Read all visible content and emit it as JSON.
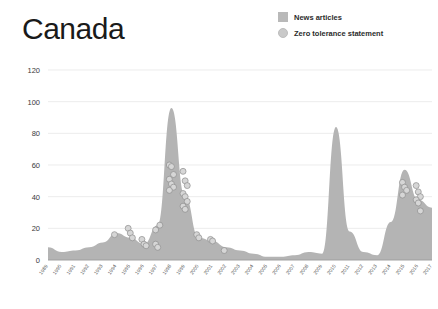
{
  "title": "Canada",
  "legend": {
    "items": [
      {
        "label": "News articles",
        "marker": "square",
        "color": "#b9b9b9"
      },
      {
        "label": "Zero tolerance statement",
        "marker": "circle",
        "color": "#c9c9c9"
      }
    ]
  },
  "chart_data": {
    "type": "area",
    "title": "Canada",
    "xlabel": "",
    "ylabel": "",
    "ylim": [
      0,
      120
    ],
    "yticks": [
      0,
      20,
      40,
      60,
      80,
      100,
      120
    ],
    "grid": true,
    "legend_position": "top-right",
    "categories": [
      "1989",
      "1990",
      "1991",
      "1992",
      "1993",
      "1994",
      "1995",
      "1996",
      "1997",
      "1998",
      "1999",
      "2000",
      "2001",
      "2002",
      "2003",
      "2004",
      "2005",
      "2006",
      "2007",
      "2008",
      "2009",
      "2010",
      "2011",
      "2012",
      "2013",
      "2014",
      "2015",
      "2016",
      "2017"
    ],
    "series": [
      {
        "name": "News articles",
        "type": "area",
        "color": "#b4b4b4",
        "values": [
          8,
          5,
          6,
          8,
          11,
          17,
          14,
          10,
          22,
          96,
          40,
          14,
          12,
          8,
          6,
          4,
          2,
          2,
          3,
          5,
          4,
          84,
          18,
          5,
          3,
          24,
          57,
          38,
          33
        ]
      },
      {
        "name": "Zero tolerance statement",
        "type": "scatter",
        "color": "#d6d6d6",
        "points": [
          {
            "x": "1994",
            "y": 16
          },
          {
            "x": "1995",
            "y": 20
          },
          {
            "x": "1995",
            "y": 17
          },
          {
            "x": "1995",
            "y": 14
          },
          {
            "x": "1996",
            "y": 13
          },
          {
            "x": "1996",
            "y": 10
          },
          {
            "x": "1996",
            "y": 9
          },
          {
            "x": "1997",
            "y": 10
          },
          {
            "x": "1997",
            "y": 8
          },
          {
            "x": "1997",
            "y": 22
          },
          {
            "x": "1997",
            "y": 19
          },
          {
            "x": "1998",
            "y": 60
          },
          {
            "x": "1998",
            "y": 59
          },
          {
            "x": "1998",
            "y": 54
          },
          {
            "x": "1998",
            "y": 51
          },
          {
            "x": "1998",
            "y": 48
          },
          {
            "x": "1998",
            "y": 46
          },
          {
            "x": "1998",
            "y": 44
          },
          {
            "x": "1999",
            "y": 56
          },
          {
            "x": "1999",
            "y": 50
          },
          {
            "x": "1999",
            "y": 47
          },
          {
            "x": "1999",
            "y": 42
          },
          {
            "x": "1999",
            "y": 40
          },
          {
            "x": "1999",
            "y": 37
          },
          {
            "x": "1999",
            "y": 34
          },
          {
            "x": "1999",
            "y": 32
          },
          {
            "x": "2000",
            "y": 16
          },
          {
            "x": "2000",
            "y": 14
          },
          {
            "x": "2001",
            "y": 13
          },
          {
            "x": "2001",
            "y": 12
          },
          {
            "x": "2002",
            "y": 6
          },
          {
            "x": "2015",
            "y": 49
          },
          {
            "x": "2015",
            "y": 46
          },
          {
            "x": "2015",
            "y": 44
          },
          {
            "x": "2015",
            "y": 41
          },
          {
            "x": "2016",
            "y": 47
          },
          {
            "x": "2016",
            "y": 43
          },
          {
            "x": "2016",
            "y": 40
          },
          {
            "x": "2016",
            "y": 38
          },
          {
            "x": "2016",
            "y": 36
          },
          {
            "x": "2016",
            "y": 31
          }
        ]
      }
    ]
  }
}
